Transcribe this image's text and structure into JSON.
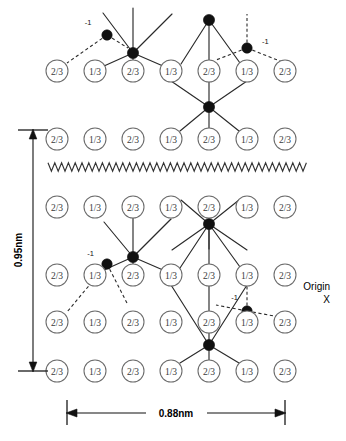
{
  "diagram": {
    "colors": {
      "background": "#ffffff",
      "site_stroke": "#6b6b6b",
      "site_text": "#3a3a3a",
      "atom_fill": "#111111",
      "bond": "#2a2a2a",
      "dimension": "#111111"
    },
    "site_labels": {
      "a": "2/3",
      "b": "1/3"
    },
    "annotations": {
      "minus_one": "-1",
      "origin_line1": "Origin",
      "origin_line2": "X"
    },
    "dimensions": {
      "vertical_label": "0.95nm",
      "horizontal_label": "0.88nm"
    },
    "rows": [
      {
        "name": "row-1",
        "y": 71,
        "labels": [
          "2/3",
          "1/3",
          "2/3",
          "1/3",
          "2/3",
          "1/3",
          "2/3"
        ]
      },
      {
        "name": "row-2",
        "y": 139,
        "labels": [
          "2/3",
          "1/3",
          "2/3",
          "1/3",
          "2/3",
          "1/3",
          "2/3"
        ]
      },
      {
        "name": "row-3",
        "y": 207,
        "labels": [
          "2/3",
          "1/3",
          "2/3",
          "1/3",
          "2/3",
          "1/3",
          "2/3"
        ]
      },
      {
        "name": "row-4",
        "y": 275,
        "labels": [
          "2/3",
          "1/3",
          "2/3",
          "1/3",
          "2/3",
          "1/3",
          "2/3"
        ]
      },
      {
        "name": "row-5",
        "y": 322,
        "labels": [
          "2/3",
          "1/3",
          "2/3",
          "1/3",
          "2/3",
          "1/3",
          "2/3"
        ]
      },
      {
        "name": "row-6",
        "y": 371,
        "labels": [
          "2/3",
          "1/3",
          "2/3",
          "1/3",
          "2/3",
          "1/3",
          "2/3"
        ]
      }
    ],
    "columns_x": [
      57,
      95,
      133,
      171,
      209,
      247,
      285
    ],
    "minus_one_count": 4
  }
}
